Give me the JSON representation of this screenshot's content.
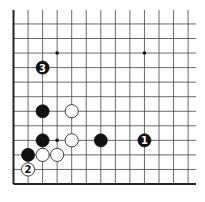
{
  "diagram": {
    "type": "go-board-corner",
    "corner": "lower-left",
    "columns_visible": 13,
    "rows_visible": 12,
    "star_points": [
      {
        "col": 4,
        "row": 4
      },
      {
        "col": 4,
        "row": 10
      },
      {
        "col": 10,
        "row": 10
      }
    ],
    "stones": [
      {
        "color": "black",
        "col": 10,
        "row": 4,
        "label": "1"
      },
      {
        "color": "white",
        "col": 2,
        "row": 2,
        "label": "2"
      },
      {
        "color": "black",
        "col": 3,
        "row": 9,
        "label": "3"
      },
      {
        "color": "black",
        "col": 3,
        "row": 6,
        "label": ""
      },
      {
        "color": "white",
        "col": 5,
        "row": 6,
        "label": ""
      },
      {
        "color": "black",
        "col": 3,
        "row": 4,
        "label": ""
      },
      {
        "color": "white",
        "col": 5,
        "row": 4,
        "label": ""
      },
      {
        "color": "black",
        "col": 7,
        "row": 4,
        "label": ""
      },
      {
        "color": "black",
        "col": 2,
        "row": 3,
        "label": ""
      },
      {
        "color": "white",
        "col": 3,
        "row": 3,
        "label": ""
      },
      {
        "color": "white",
        "col": 4,
        "row": 3,
        "label": ""
      }
    ],
    "colors": {
      "line": "#444444",
      "edge": "#222222",
      "black_stone": "#111111",
      "white_stone": "#ffffff",
      "background": "#ffffff"
    }
  }
}
